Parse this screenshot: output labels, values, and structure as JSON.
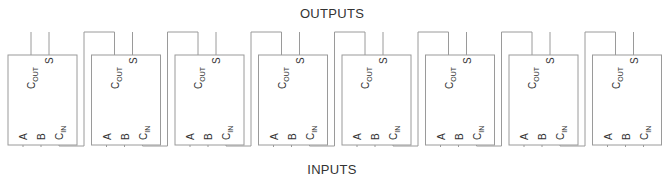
{
  "diagram": {
    "title_top": "OUTPUTS",
    "title_bottom": "INPUTS",
    "adder_count": 8,
    "adder_pins": {
      "carry_out": {
        "main": "C",
        "sub": "OUT"
      },
      "sum": "S",
      "input_a": "A",
      "input_b": "B",
      "carry_in": {
        "main": "C",
        "sub": "IN"
      }
    },
    "colors": {
      "line": "#9a9a9a",
      "text": "#333333",
      "background": "#ffffff"
    }
  }
}
